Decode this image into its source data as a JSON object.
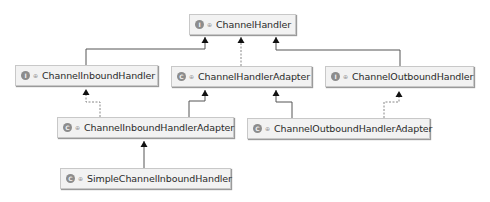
{
  "diagram": {
    "type": "uml-class-hierarchy",
    "colors": {
      "node_fill": "#f2f2f2",
      "node_border": "#c8c8c8",
      "edge": "#555555",
      "badge": "#8c8c8c"
    },
    "nodes": [
      {
        "id": "channel-handler",
        "label": "ChannelHandler",
        "kind": "interface",
        "badge": "I",
        "visibility_icon": "public-visibility-icon"
      },
      {
        "id": "channel-inbound-handler",
        "label": "ChannelInboundHandler",
        "kind": "interface",
        "badge": "I",
        "visibility_icon": "public-visibility-icon"
      },
      {
        "id": "channel-handler-adapter",
        "label": "ChannelHandlerAdapter",
        "kind": "class",
        "badge": "C",
        "visibility_icon": "public-visibility-icon"
      },
      {
        "id": "channel-outbound-handler",
        "label": "ChannelOutboundHandler",
        "kind": "interface",
        "badge": "I",
        "visibility_icon": "public-visibility-icon"
      },
      {
        "id": "channel-inbound-handler-adapter",
        "label": "ChannelInboundHandlerAdapter",
        "kind": "class",
        "badge": "C",
        "visibility_icon": "public-visibility-icon"
      },
      {
        "id": "channel-outbound-handler-adapter",
        "label": "ChannelOutboundHandlerAdapter",
        "kind": "class",
        "badge": "C",
        "visibility_icon": "public-visibility-icon"
      },
      {
        "id": "simple-channel-inbound-handler",
        "label": "SimpleChannelInboundHandler",
        "kind": "class",
        "badge": "C",
        "visibility_icon": "public-visibility-icon"
      }
    ],
    "edges": [
      {
        "from": "channel-inbound-handler",
        "to": "channel-handler",
        "relation": "extends",
        "style": "solid"
      },
      {
        "from": "channel-handler-adapter",
        "to": "channel-handler",
        "relation": "implements",
        "style": "dashed"
      },
      {
        "from": "channel-outbound-handler",
        "to": "channel-handler",
        "relation": "extends",
        "style": "solid"
      },
      {
        "from": "channel-inbound-handler-adapter",
        "to": "channel-inbound-handler",
        "relation": "implements",
        "style": "dashed"
      },
      {
        "from": "channel-inbound-handler-adapter",
        "to": "channel-handler-adapter",
        "relation": "extends",
        "style": "solid"
      },
      {
        "from": "channel-outbound-handler-adapter",
        "to": "channel-handler-adapter",
        "relation": "extends",
        "style": "solid"
      },
      {
        "from": "channel-outbound-handler-adapter",
        "to": "channel-outbound-handler",
        "relation": "implements",
        "style": "dashed"
      },
      {
        "from": "simple-channel-inbound-handler",
        "to": "channel-inbound-handler-adapter",
        "relation": "extends",
        "style": "solid"
      }
    ]
  }
}
